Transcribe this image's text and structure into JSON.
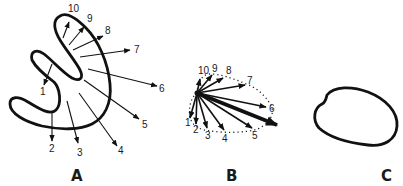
{
  "figure": {
    "colors": {
      "ink": "#111111",
      "background": "#ffffff"
    },
    "panels": [
      {
        "id": "A",
        "label": "A",
        "description": "Curved outline with 10 numbered outward arrows",
        "vector_labels": [
          "1",
          "2",
          "3",
          "4",
          "5",
          "6",
          "7",
          "8",
          "9",
          "10"
        ]
      },
      {
        "id": "B",
        "label": "B",
        "description": "The same 10 vectors drawn from a common origin with dotted envelope and bold resultant vector",
        "vector_labels": [
          "1",
          "2",
          "3",
          "4",
          "5",
          "6",
          "7",
          "8",
          "9",
          "10"
        ]
      },
      {
        "id": "C",
        "label": "C",
        "description": "Closed loop outline"
      }
    ]
  }
}
